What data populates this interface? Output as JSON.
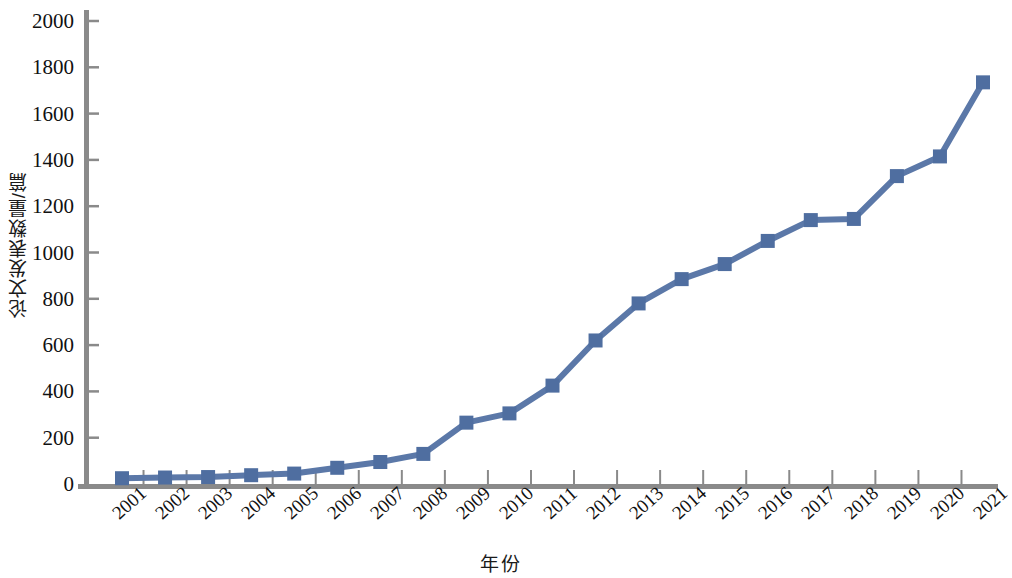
{
  "chart_data": {
    "type": "line",
    "title": "",
    "xlabel": "年份",
    "ylabel": "论文发表数量/篇",
    "categories": [
      "2001",
      "2002",
      "2003",
      "2004",
      "2005",
      "2006",
      "2007",
      "2008",
      "2009",
      "2010",
      "2011",
      "2012",
      "2013",
      "2014",
      "2015",
      "2016",
      "2017",
      "2018",
      "2019",
      "2020",
      "2021"
    ],
    "series": [
      {
        "name": "论文发表数量",
        "values": [
          25,
          28,
          30,
          38,
          45,
          70,
          95,
          130,
          265,
          305,
          425,
          620,
          780,
          885,
          950,
          1050,
          1140,
          1145,
          1330,
          1415,
          1735
        ]
      }
    ],
    "ylim": [
      0,
      2000
    ],
    "y_ticks": [
      0,
      200,
      400,
      600,
      800,
      1000,
      1200,
      1400,
      1600,
      1800,
      2000
    ],
    "y_tick_labels": [
      "0",
      "200",
      "400",
      "600",
      "800",
      "1000",
      "1200",
      "1400",
      "1600",
      "1800",
      "2000"
    ],
    "grid": false,
    "legend": "none",
    "marker": "square",
    "line_color": "#5B78A8",
    "marker_color": "#4F6EA0",
    "axis_color": "#8A8A8A"
  }
}
